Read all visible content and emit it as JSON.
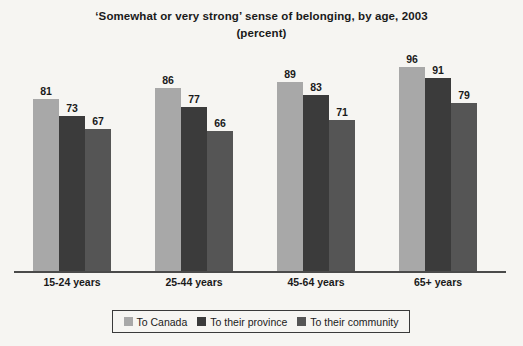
{
  "chart_data": {
    "type": "bar",
    "title": "‘Somewhat or very strong’ sense of belonging, by age, 2003",
    "subtitle": "(percent)",
    "xlabel": "",
    "ylabel": "",
    "ylim": [
      0,
      100
    ],
    "grid": false,
    "legend_position": "bottom",
    "categories": [
      "15-24 years",
      "25-44 years",
      "45-64 years",
      "65+ years"
    ],
    "series": [
      {
        "name": "To Canada",
        "color": "#a8a8a8",
        "values": [
          81,
          86,
          89,
          96
        ]
      },
      {
        "name": "To their province",
        "color": "#3b3b3b",
        "values": [
          73,
          77,
          83,
          91
        ]
      },
      {
        "name": "To their community",
        "color": "#555555",
        "values": [
          67,
          66,
          71,
          79
        ]
      }
    ]
  }
}
